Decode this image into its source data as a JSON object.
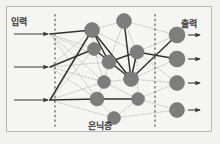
{
  "figure": {
    "type": "diagram",
    "width": 220,
    "height": 144,
    "background_color": "#f5f5f3",
    "frame_color": "#b9b9b5"
  },
  "labels": {
    "input": "입력",
    "output": "출력",
    "hidden": "은닉층"
  },
  "colors": {
    "node_fill": "#7d7d7d",
    "node_stroke": "#6a6a6a",
    "active_edge": "#333333",
    "inactive_edge": "#b5b5b5",
    "divider": "#555555",
    "arrow": "#3a3a3a",
    "label_text": "#3a3a3a"
  },
  "dividers": [
    {
      "name": "input-hidden-divider",
      "x": 55
    },
    {
      "name": "hidden-output-divider",
      "x": 155
    }
  ],
  "input_arrows": [
    {
      "name": "input-arrow-1",
      "x1": 14,
      "y1": 34,
      "x2": 48,
      "y2": 34
    },
    {
      "name": "input-arrow-2",
      "x1": 14,
      "y1": 67,
      "x2": 48,
      "y2": 67
    },
    {
      "name": "input-arrow-3",
      "x1": 14,
      "y1": 100,
      "x2": 48,
      "y2": 100
    }
  ],
  "output_arrows": [
    {
      "name": "output-arrow-1",
      "x1": 188,
      "y1": 35,
      "x2": 200,
      "y2": 35
    },
    {
      "name": "output-arrow-2",
      "x1": 188,
      "y1": 59,
      "x2": 200,
      "y2": 59
    },
    {
      "name": "output-arrow-3",
      "x1": 188,
      "y1": 83,
      "x2": 200,
      "y2": 83
    },
    {
      "name": "output-arrow-4",
      "x1": 188,
      "y1": 110,
      "x2": 200,
      "y2": 110
    }
  ],
  "nodes": {
    "input_terminals": [
      {
        "id": "i1",
        "x": 50,
        "y": 34
      },
      {
        "id": "i2",
        "x": 50,
        "y": 67
      },
      {
        "id": "i3",
        "x": 50,
        "y": 100
      }
    ],
    "hidden": [
      {
        "id": "h1",
        "x": 92,
        "y": 30,
        "r": 7.5
      },
      {
        "id": "h2",
        "x": 124,
        "y": 21,
        "r": 7.5
      },
      {
        "id": "h3",
        "x": 94,
        "y": 49,
        "r": 6.5
      },
      {
        "id": "h4",
        "x": 109,
        "y": 62,
        "r": 7.0
      },
      {
        "id": "h5",
        "x": 137,
        "y": 52,
        "r": 7.0
      },
      {
        "id": "h6",
        "x": 104,
        "y": 82,
        "r": 6.5
      },
      {
        "id": "h7",
        "x": 131,
        "y": 79,
        "r": 7.5
      },
      {
        "id": "h8",
        "x": 97,
        "y": 99,
        "r": 7.0
      },
      {
        "id": "h9",
        "x": 138,
        "y": 99,
        "r": 6.5
      },
      {
        "id": "h10",
        "x": 114,
        "y": 118,
        "r": 6.5
      }
    ],
    "output": [
      {
        "id": "o1",
        "x": 177,
        "y": 35,
        "r": 8.0
      },
      {
        "id": "o2",
        "x": 177,
        "y": 59,
        "r": 8.0
      },
      {
        "id": "o3",
        "x": 177,
        "y": 83,
        "r": 7.5
      },
      {
        "id": "o4",
        "x": 177,
        "y": 110,
        "r": 7.5
      }
    ]
  },
  "edges_active": [
    {
      "from": "i1",
      "to": "h1"
    },
    {
      "from": "i2",
      "to": "h3"
    },
    {
      "from": "i3",
      "to": "h1"
    },
    {
      "from": "i3",
      "to": "h8"
    },
    {
      "from": "h1",
      "to": "h4"
    },
    {
      "from": "h1",
      "to": "h7"
    },
    {
      "from": "h3",
      "to": "h7"
    },
    {
      "from": "h4",
      "to": "h5"
    },
    {
      "from": "h5",
      "to": "h7"
    },
    {
      "from": "h7",
      "to": "o1"
    },
    {
      "from": "h5",
      "to": "o2"
    },
    {
      "from": "h8",
      "to": "h9"
    },
    {
      "from": "h2",
      "to": "h7"
    }
  ],
  "edges_inactive": [
    {
      "from": "i1",
      "to": "h3"
    },
    {
      "from": "i1",
      "to": "h6"
    },
    {
      "from": "i1",
      "to": "h8"
    },
    {
      "from": "i1",
      "to": "h4"
    },
    {
      "from": "i2",
      "to": "h1"
    },
    {
      "from": "i2",
      "to": "h4"
    },
    {
      "from": "i2",
      "to": "h6"
    },
    {
      "from": "i2",
      "to": "h8"
    },
    {
      "from": "i3",
      "to": "h6"
    },
    {
      "from": "i3",
      "to": "h10"
    },
    {
      "from": "i3",
      "to": "h3"
    },
    {
      "from": "h1",
      "to": "h2"
    },
    {
      "from": "h1",
      "to": "h5"
    },
    {
      "from": "h1",
      "to": "h3"
    },
    {
      "from": "h2",
      "to": "h5"
    },
    {
      "from": "h3",
      "to": "h4"
    },
    {
      "from": "h3",
      "to": "h6"
    },
    {
      "from": "h4",
      "to": "h7"
    },
    {
      "from": "h6",
      "to": "h7"
    },
    {
      "from": "h6",
      "to": "h8"
    },
    {
      "from": "h6",
      "to": "h9"
    },
    {
      "from": "h8",
      "to": "h10"
    },
    {
      "from": "h10",
      "to": "h9"
    },
    {
      "from": "h9",
      "to": "h5"
    },
    {
      "from": "h2",
      "to": "o1"
    },
    {
      "from": "h5",
      "to": "o1"
    },
    {
      "from": "h5",
      "to": "o3"
    },
    {
      "from": "h7",
      "to": "o2"
    },
    {
      "from": "h7",
      "to": "o3"
    },
    {
      "from": "h9",
      "to": "o3"
    },
    {
      "from": "h9",
      "to": "o4"
    },
    {
      "from": "h10",
      "to": "o4"
    },
    {
      "from": "h2",
      "to": "h4"
    },
    {
      "from": "h4",
      "to": "h6"
    }
  ]
}
